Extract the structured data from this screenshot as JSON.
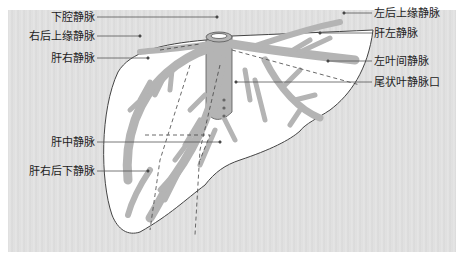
{
  "diagram": {
    "colors": {
      "background": "#e0e0e0",
      "liver": "#ffffff",
      "vessel": "#b4b4b4",
      "outline": "#444444",
      "leader": "#555555"
    },
    "labels_left": [
      {
        "text": "下腔静脉",
        "x": 97,
        "y": 17,
        "tx": 217,
        "ty": 17
      },
      {
        "text": "右后上缘静脉",
        "x": 97,
        "y": 36,
        "tx": 140,
        "ty": 36
      },
      {
        "text": "肝右静脉",
        "x": 97,
        "y": 58,
        "tx": 148,
        "ty": 58
      },
      {
        "text": "肝中静脉",
        "x": 97,
        "y": 142,
        "tx": 220,
        "ty": 142
      },
      {
        "text": "肝右后下静脉",
        "x": 97,
        "y": 171,
        "tx": 148,
        "ty": 171
      }
    ],
    "labels_right": [
      {
        "text": "左后上缘静脉",
        "x": 372,
        "y": 13,
        "tx": 344,
        "ty": 13
      },
      {
        "text": "肝左静脉",
        "x": 372,
        "y": 33,
        "tx": 320,
        "ty": 33
      },
      {
        "text": "左叶间静脉",
        "x": 372,
        "y": 61,
        "tx": 328,
        "ty": 61
      },
      {
        "text": "尾状叶静脉口",
        "x": 372,
        "y": 82,
        "tx": 236,
        "ty": 82
      }
    ]
  }
}
